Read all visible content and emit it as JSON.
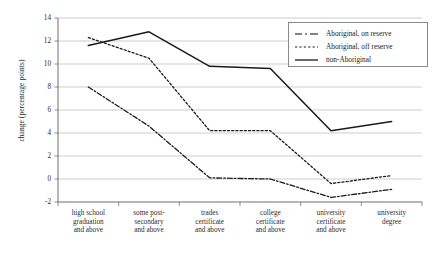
{
  "chart_data": {
    "type": "line",
    "title": "",
    "xlabel": "",
    "ylabel": "change (percentage points)",
    "ylim": [
      -2,
      14
    ],
    "ytick_step": 2,
    "yticks": [
      "14",
      "12",
      "10",
      "8",
      "6",
      "4",
      "2",
      "0",
      "-2"
    ],
    "grid": true,
    "legend_position": "top-right",
    "categories": [
      "high school graduation and above",
      "some post-secondary and above",
      "trades certificate and above",
      "college certificate and above",
      "university certificate and above",
      "university degree"
    ],
    "category_lines": [
      [
        "high school",
        "graduation",
        "and above"
      ],
      [
        "some post-",
        "secondary",
        "and above"
      ],
      [
        "trades",
        "certificate",
        "and above"
      ],
      [
        "college",
        "certificate",
        "and above"
      ],
      [
        "university",
        "certificate",
        "and above"
      ],
      [
        "university",
        "degree"
      ]
    ],
    "series": [
      {
        "name": "Aboriginal, on reserve",
        "style": "dash-dot",
        "color": "#1a1a1a",
        "values": [
          8.0,
          4.6,
          0.1,
          0.0,
          -1.6,
          -0.9
        ]
      },
      {
        "name": "Aboriginal, off reserve",
        "style": "dotted",
        "color": "#1a1a1a",
        "values": [
          12.3,
          10.5,
          4.2,
          4.2,
          -0.4,
          0.3
        ]
      },
      {
        "name": "non-Aboriginal",
        "style": "solid",
        "color": "#1a1a1a",
        "values": [
          11.6,
          12.8,
          9.8,
          9.6,
          4.2,
          5.0
        ]
      }
    ]
  },
  "legend": {
    "items": [
      {
        "label": "Aboriginal, on reserve",
        "style": "dash-dot"
      },
      {
        "label": "Aboriginal, off reserve",
        "style": "dotted"
      },
      {
        "label": "non-Aboriginal",
        "style": "solid"
      }
    ]
  },
  "axis": {
    "y_title": "change (percentage points)"
  }
}
